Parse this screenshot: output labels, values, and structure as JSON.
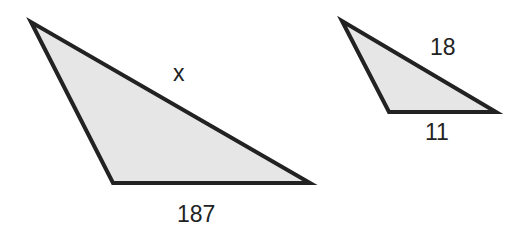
{
  "figure": {
    "fill_color": "#e6e6e6",
    "stroke_color": "#222222",
    "large_triangle": {
      "side_label_slanted": "x",
      "side_label_base": "187"
    },
    "small_triangle": {
      "side_label_slanted": "18",
      "side_label_base": "11"
    }
  }
}
